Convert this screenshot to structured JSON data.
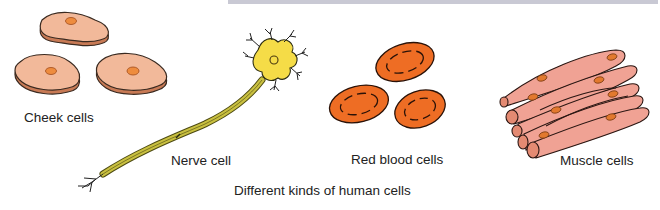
{
  "figure": {
    "caption": "Different kinds of human cells",
    "colors": {
      "cheek_fill": "#f2b99a",
      "cheek_nucleus": "#ee8c3e",
      "nerve_body": "#f5dc47",
      "nerve_axon": "#c9c040",
      "rbc_fill": "#ee6d24",
      "muscle_fill": "#f0a294",
      "muscle_nucleus": "#e2792e",
      "top_bar": "#c9c9d4"
    },
    "cells": [
      {
        "id": "cheek",
        "label": "Cheek cells",
        "count": 3
      },
      {
        "id": "nerve",
        "label": "Nerve cell",
        "count": 1
      },
      {
        "id": "red-blood",
        "label": "Red blood cells",
        "count": 3
      },
      {
        "id": "muscle",
        "label": "Muscle cells",
        "count": 7
      }
    ]
  }
}
